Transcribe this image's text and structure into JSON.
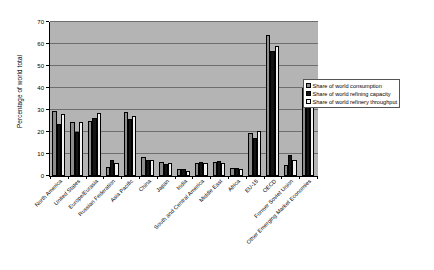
{
  "chart_data": {
    "type": "bar",
    "title": "",
    "xlabel": "",
    "ylabel": "Percentage of world total",
    "ylim": [
      0,
      70
    ],
    "yticks": [
      0,
      10,
      20,
      30,
      40,
      50,
      60,
      70
    ],
    "grid": true,
    "legend_position": "right",
    "categories": [
      "North America",
      "United States",
      "Europe/Eurasia",
      "Russian Federation",
      "Asia Pacific",
      "China",
      "Japan",
      "India",
      "South and Central America",
      "Middle East",
      "Africa",
      "EU-15",
      "OECD",
      "Former Soviet Union",
      "Other Emerging Market Economies"
    ],
    "series": [
      {
        "name": "Share of world consumption",
        "color": "#8c8c8c",
        "values": [
          29.5,
          24.5,
          25.0,
          4.0,
          29.0,
          8.5,
          6.5,
          3.0,
          6.0,
          6.5,
          3.5,
          19.5,
          64.0,
          5.0,
          40.0
        ]
      },
      {
        "name": "Share of world refining capacity",
        "color": "#141414",
        "values": [
          23.5,
          20.0,
          26.5,
          7.5,
          26.0,
          7.5,
          5.5,
          3.0,
          6.5,
          7.0,
          3.5,
          17.5,
          57.0,
          9.5,
          38.0
        ]
      },
      {
        "name": "Share of world refinery throughput",
        "color": "#f2f2f2",
        "values": [
          28.0,
          24.5,
          28.5,
          6.0,
          27.5,
          7.5,
          6.0,
          2.5,
          6.0,
          6.0,
          3.0,
          20.5,
          59.0,
          7.5,
          42.0
        ]
      }
    ]
  },
  "legend": {
    "items": [
      "Share of world consumption",
      "Share of world refining capacity",
      "Share of world refinery throughput"
    ]
  }
}
